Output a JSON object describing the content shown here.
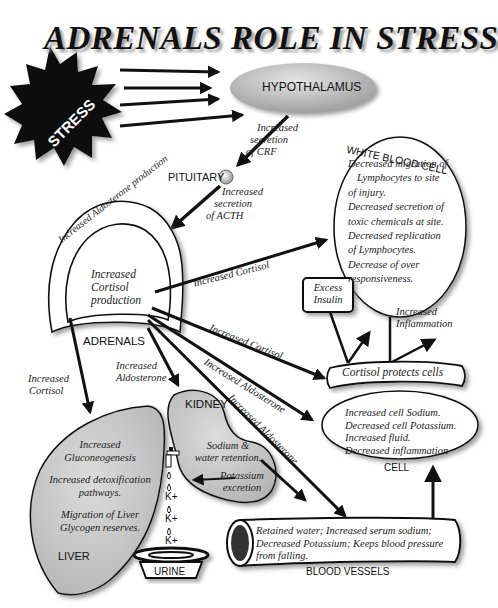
{
  "title": "ADRENALS ROLE IN STRESS",
  "nodes": {
    "stress": "STRESS",
    "hypothalamus": "HYPOTHALAMUS",
    "pituitary": "PITUITARY",
    "adrenals": "ADRENALS",
    "adrenals_outer": "Increased Aldosterone production",
    "adrenals_inner": [
      "Increased",
      "Cortisol",
      "production"
    ],
    "white_blood_cell": {
      "label": "WHITE BLOOD CELL",
      "lines": [
        "Decreased migration of",
        "Lymphocytes to site",
        "of    injury.",
        "Decreased secretion of",
        "toxic chemicals at site.",
        "Decreased replication",
        "of Lymphocytes.",
        "Decrease of over",
        "responsiveness."
      ]
    },
    "excess_insulin": [
      "Excess",
      "Insulin"
    ],
    "cortisol_protects": "Cortisol protects cells",
    "cell": {
      "label": "CELL",
      "lines": [
        "Increased cell Sodium.",
        "Decreased cell Potassium.",
        "Increased fluid.",
        "Decreased inflammation"
      ]
    },
    "liver": {
      "label": "LIVER",
      "lines": [
        "Increased",
        "Gluconeogenesis",
        "Increased detoxification",
        "pathways.",
        "Migration of Liver",
        "Glycogen reserves."
      ]
    },
    "kidney": {
      "label": "KIDNEY",
      "lines": [
        "Sodium &",
        "water retention."
      ],
      "excretion": [
        "Potassium",
        "excretion"
      ]
    },
    "urine": "URINE",
    "potassium_drops": [
      "K+",
      "K+",
      "K+"
    ],
    "blood_vessels": {
      "label": "BLOOD VESSELS",
      "lines": [
        "Retained water; Increased serum sodium;",
        "Decreased Potassium; Keeps blood pressure",
        "from falling."
      ]
    }
  },
  "edges": {
    "crf": [
      "Increased",
      "secretion",
      "of CRF"
    ],
    "acth": [
      "Increased",
      "secretion",
      "of ACTH"
    ],
    "cortisol_to_wbc": "Increased Cortisol",
    "cortisol_to_cells": "Increased Cortisol",
    "aldosterone_to_cell": "Increased Aldosterone",
    "aldosterone_to_vessels": "Increased Aldosterone",
    "aldosterone_to_kidney": [
      "Increased",
      "Aldosterone"
    ],
    "cortisol_to_liver": [
      "Increased",
      "Cortisol"
    ],
    "inflammation": [
      "Increased",
      "Inflammation"
    ]
  },
  "colors": {
    "ink": "#111111",
    "organ_fill": "#c8c8c8",
    "hypothalamus_fill": "#b8b8b8",
    "background": "#ffffff"
  }
}
